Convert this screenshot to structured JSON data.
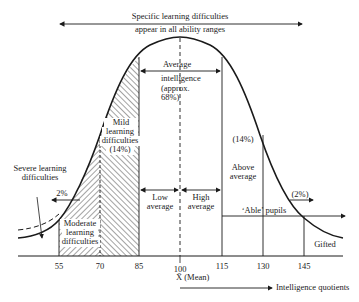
{
  "header": {
    "line1": "Specific learning difficulties",
    "line2": "appear in all ability ranges"
  },
  "regions": {
    "average": {
      "l1": "Average",
      "l2": "intelligence",
      "l3": "(approx.",
      "l4": "68%)"
    },
    "mild": {
      "l1": "Mild",
      "l2": "learning",
      "l3": "difficulties",
      "l4": "(14%)"
    },
    "moderate": {
      "l1": "Moderate",
      "l2": "learning",
      "l3": "difficulties"
    },
    "severe": {
      "l1": "Severe learning",
      "l2": "difficulties"
    },
    "severe_pct": "2%",
    "low_average": {
      "l1": "Low",
      "l2": "average"
    },
    "high_average": {
      "l1": "High",
      "l2": "average"
    },
    "above_average": {
      "l1": "Above",
      "l2": "average"
    },
    "above_pct": "(14%)",
    "gifted_pct": "(2%)",
    "able_pupils": "‘Able’ pupils",
    "gifted": "Gifted"
  },
  "axis": {
    "ticks": [
      "55",
      "70",
      "85",
      "100",
      "115",
      "130",
      "145"
    ],
    "mean_label": "X̄ (Mean)",
    "xlabel": "Intelligence quotients"
  },
  "colors": {
    "line": "#1a1a1a",
    "hatch": "#333333",
    "background": "#ffffff"
  }
}
